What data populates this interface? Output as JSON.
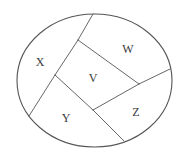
{
  "diagram": {
    "type": "region-partition",
    "canvas": {
      "width": 182,
      "height": 159,
      "background": "#ffffff"
    },
    "stroke_color": "#555555",
    "label_color": "#3a3a3a",
    "outer_shape": {
      "shape": "ellipse",
      "cx": 94.5,
      "cy": 80.5,
      "rx": 77.5,
      "ry": 66.5,
      "stroke_width": 1.1
    },
    "divider_lines": [
      {
        "id": "left-divider-upper",
        "x1": 93,
        "y1": 14,
        "x2": 78,
        "y2": 40
      },
      {
        "id": "left-divider-middle",
        "x1": 78,
        "y1": 40,
        "x2": 55,
        "y2": 75
      },
      {
        "id": "left-divider-lower",
        "x1": 55,
        "y1": 75,
        "x2": 29,
        "y2": 116
      },
      {
        "id": "v-top-edge",
        "x1": 78,
        "y1": 40,
        "x2": 139,
        "y2": 84
      },
      {
        "id": "w-z-divider",
        "x1": 139,
        "y1": 84,
        "x2": 170,
        "y2": 69
      },
      {
        "id": "v-bottom-edge",
        "x1": 139,
        "y1": 84,
        "x2": 93,
        "y2": 110
      },
      {
        "id": "y-divider-upper",
        "x1": 55,
        "y1": 75,
        "x2": 93,
        "y2": 110
      },
      {
        "id": "y-z-divider",
        "x1": 93,
        "y1": 110,
        "x2": 124,
        "y2": 141
      }
    ],
    "regions": [
      {
        "label": "X",
        "x": 40,
        "y": 62
      },
      {
        "label": "W",
        "x": 128,
        "y": 49
      },
      {
        "label": "V",
        "x": 93,
        "y": 78
      },
      {
        "label": "Y",
        "x": 66,
        "y": 118
      },
      {
        "label": "Z",
        "x": 136,
        "y": 112
      }
    ]
  }
}
